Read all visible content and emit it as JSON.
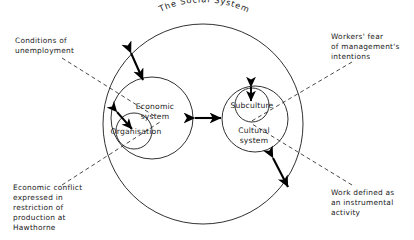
{
  "figure": {
    "title": "The Social System",
    "background_color": "#ffffff",
    "ink_color": "#1a1a1a"
  },
  "systems": {
    "outer": {
      "label": "The Social System"
    },
    "economic": {
      "line1": "Economic",
      "line2": "system"
    },
    "organisation": {
      "label": "Organisation"
    },
    "cultural": {
      "line1": "Cultural",
      "line2": "system"
    },
    "subculture": {
      "label": "Subculture"
    }
  },
  "annotations": [
    {
      "id": "conditions-of-unemployment",
      "position": "top-left",
      "lines": [
        "Conditions  of",
        "unemployment"
      ]
    },
    {
      "id": "workers-fear",
      "position": "top-right",
      "lines": [
        "Workers' fear",
        "of  management's",
        "intentions"
      ]
    },
    {
      "id": "economic-conflict",
      "position": "bottom-left",
      "lines": [
        "Economic  conflict",
        "expressed  in",
        "restriction  of",
        "production  at",
        "Hawthorne"
      ]
    },
    {
      "id": "work-defined",
      "position": "bottom-right",
      "lines": [
        "Work defined  as",
        "an  instrumental",
        "activity"
      ]
    }
  ],
  "relations": [
    {
      "id": "unemployment-to-economic",
      "kind": "double-arrow"
    },
    {
      "id": "economic-to-organisation",
      "kind": "double-arrow"
    },
    {
      "id": "economic-to-cultural",
      "kind": "double-arrow"
    },
    {
      "id": "cultural-to-subculture",
      "kind": "double-arrow"
    },
    {
      "id": "cultural-to-social-boundary",
      "kind": "double-arrow"
    }
  ]
}
